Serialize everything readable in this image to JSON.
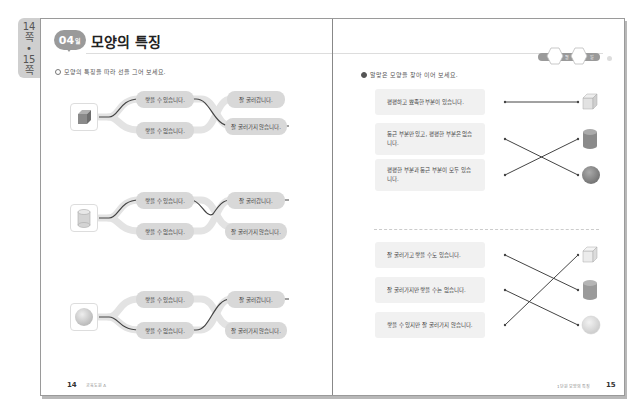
{
  "side_tab": {
    "line1": "14",
    "line2": "쪽",
    "line3": "•",
    "line4": "15",
    "line5": "쪽"
  },
  "left_page": {
    "lesson_badge": {
      "number": "04",
      "suffix": "일"
    },
    "title": "모양의 특징",
    "instruction": "모양의 특징을 따라 선을 그어 보세요.",
    "rows": [
      {
        "shape": "cube",
        "top_left": "쌓을 수 있습니다.",
        "bottom_left": "쌓을 수 없습니다.",
        "top_right": "잘 굴러갑니다.",
        "bottom_right": "잘 굴러가지 않습니다."
      },
      {
        "shape": "cylinder",
        "top_left": "쌓을 수 있습니다.",
        "bottom_left": "쌓을 수 없습니다.",
        "top_right": "잘 굴러갑니다.",
        "bottom_right": "잘 굴러가지 않습니다."
      },
      {
        "shape": "sphere",
        "top_left": "쌓을 수 있습니다.",
        "bottom_left": "쌓을 수 없습니다.",
        "top_right": "잘 굴러갑니다.",
        "bottom_right": "잘 굴러가지 않습니다."
      }
    ],
    "page_number": "14",
    "publisher": "교육도원 A"
  },
  "right_page": {
    "instruction": "알맞은 모양을 찾아 이어 보세요.",
    "group1": [
      {
        "text": "평평하고 뾰족한 부분이 있습니다."
      },
      {
        "text": "둥근 부분만 있고, 평평한 부분은 없습니다."
      },
      {
        "text": "평평한 부분과 둥근 부분이 모두 있습니다."
      }
    ],
    "group1_shapes": [
      "cube",
      "cylinder",
      "sphere"
    ],
    "group2": [
      {
        "text": "잘 굴러가고 쌓을 수도 있습니다."
      },
      {
        "text": "잘 굴러가지만 쌓을 수는 없습니다."
      },
      {
        "text": "쌓을 수 있지만 잘 굴러가지 않습니다."
      }
    ],
    "group2_shapes": [
      "cube",
      "cylinder",
      "sphere"
    ],
    "chapter_label": "1단원 모양의 특징",
    "page_number": "15",
    "hex_labels": [
      "월",
      "일"
    ]
  },
  "colors": {
    "badge": "#9a9a9a",
    "pill": "#d8d8d8",
    "box": "#f1f1f1",
    "line": "#444444"
  }
}
